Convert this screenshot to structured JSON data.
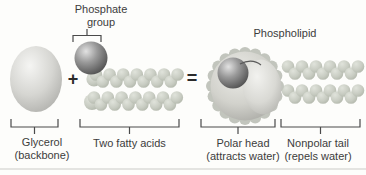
{
  "figure": {
    "labels": {
      "phosphate_group_line1": "Phosphate",
      "phosphate_group_line2": "group",
      "phospholipid": "Phospholipid",
      "glycerol_line1": "Glycerol",
      "glycerol_line2": "(backbone)",
      "two_fatty_acids": "Two fatty acids",
      "polar_head_line1": "Polar head",
      "polar_head_line2": "(attracts water)",
      "nonpolar_tail_line1": "Nonpolar tail",
      "nonpolar_tail_line2": "(repels water)"
    },
    "operators": {
      "plus": "+",
      "equals": "="
    },
    "colors": {
      "background": "#fdfdfb",
      "text": "#3c3c3c",
      "bracket": "#4a4a4a",
      "phosphate_sphere_dark": "#6b6b6b",
      "light_shapes": "#d2d5cc",
      "chain": "#c9cdc3"
    }
  }
}
